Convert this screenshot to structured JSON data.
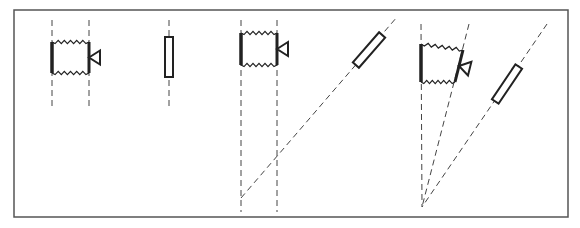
{
  "diagram": {
    "colors": {
      "stroke": "#222222",
      "dash": "#444444",
      "frame": "#555555",
      "background": "#ffffff"
    },
    "frame": {
      "x": 14,
      "y": 10,
      "width": 554,
      "height": 207
    },
    "panels": [
      {
        "id": "panel-1",
        "label": "parallel view, camera and upright rod",
        "camera": {
          "left": 52,
          "right": 89,
          "top": 42,
          "bottom": 73,
          "lens_tip_x": 100
        },
        "guide_lines": [
          {
            "x1": 52,
            "y1": 20,
            "x2": 52,
            "y2": 110
          },
          {
            "x1": 89,
            "y1": 20,
            "x2": 89,
            "y2": 110
          },
          {
            "x1": 169,
            "y1": 20,
            "x2": 169,
            "y2": 110
          }
        ],
        "rod": {
          "cx": 169,
          "cy": 57,
          "length": 40,
          "width": 8,
          "angle": 0
        }
      },
      {
        "id": "panel-2",
        "label": "parallel projection to tilted rod",
        "camera": {
          "left": 241,
          "right": 277,
          "top": 33,
          "bottom": 65,
          "lens_tip_x": 288
        },
        "guide_lines": [
          {
            "x1": 241,
            "y1": 20,
            "x2": 241,
            "y2": 212
          },
          {
            "x1": 277,
            "y1": 20,
            "x2": 277,
            "y2": 212
          },
          {
            "x1": 241,
            "y1": 198,
            "x2": 397,
            "y2": 17
          }
        ],
        "rod": {
          "cx": 369,
          "cy": 50,
          "length": 40,
          "width": 8,
          "angle": -49
        }
      },
      {
        "id": "panel-3",
        "label": "converging projection with tilted camera and rod",
        "camera": {
          "left": 421,
          "top": 44,
          "bottom": 82,
          "right_top": [
            463,
            50
          ],
          "right_bottom": [
            455,
            82
          ]
        },
        "guide_lines": [
          {
            "x1": 421,
            "y1": 24,
            "x2": 422,
            "y2": 207
          },
          {
            "x1": 469,
            "y1": 24,
            "x2": 422,
            "y2": 207
          },
          {
            "x1": 547,
            "y1": 24,
            "x2": 422,
            "y2": 207
          }
        ],
        "rod": {
          "cx": 507,
          "cy": 84,
          "length": 42,
          "width": 8,
          "angle": -56
        }
      }
    ]
  }
}
